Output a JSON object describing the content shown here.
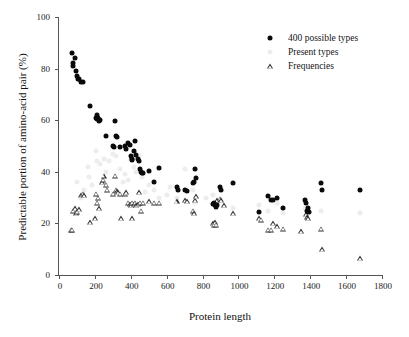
{
  "chart_data": {
    "type": "scatter",
    "title": "",
    "xlabel": "Protein length",
    "ylabel": "Predictable portion of amino-acid pair (%)",
    "xlim": [
      0,
      1800
    ],
    "ylim": [
      0,
      100
    ],
    "xticks": [
      0,
      200,
      400,
      600,
      800,
      1000,
      1200,
      1400,
      1600,
      1800
    ],
    "yticks": [
      0,
      20,
      40,
      60,
      80,
      100
    ],
    "grid": false,
    "legend_position": "top-right",
    "series": [
      {
        "name": "400 possible types",
        "marker": "filled-circle",
        "color": "#0a0a0a",
        "points": [
          [
            70,
            86
          ],
          [
            78,
            81
          ],
          [
            80,
            82
          ],
          [
            88,
            84
          ],
          [
            95,
            79
          ],
          [
            100,
            77
          ],
          [
            108,
            76
          ],
          [
            112,
            76
          ],
          [
            125,
            75
          ],
          [
            132,
            75
          ],
          [
            175,
            65.5
          ],
          [
            205,
            61
          ],
          [
            210,
            62
          ],
          [
            213,
            60.5
          ],
          [
            218,
            61
          ],
          [
            222,
            59.5
          ],
          [
            228,
            60
          ],
          [
            262,
            54
          ],
          [
            300,
            50
          ],
          [
            305,
            49.5
          ],
          [
            312,
            59.5
          ],
          [
            318,
            54
          ],
          [
            322,
            53.5
          ],
          [
            340,
            49.5
          ],
          [
            370,
            50
          ],
          [
            375,
            49
          ],
          [
            385,
            51
          ],
          [
            395,
            50.5
          ],
          [
            400,
            46
          ],
          [
            405,
            45
          ],
          [
            408,
            44.5
          ],
          [
            418,
            48
          ],
          [
            422,
            52
          ],
          [
            430,
            46.5
          ],
          [
            438,
            45
          ],
          [
            448,
            44
          ],
          [
            452,
            41
          ],
          [
            458,
            40
          ],
          [
            462,
            39.5
          ],
          [
            468,
            39.5
          ],
          [
            500,
            40.5
          ],
          [
            530,
            36
          ],
          [
            560,
            41.5
          ],
          [
            655,
            34
          ],
          [
            662,
            33
          ],
          [
            700,
            33
          ],
          [
            712,
            32.5
          ],
          [
            745,
            35.5
          ],
          [
            752,
            36
          ],
          [
            760,
            41
          ],
          [
            765,
            37.5
          ],
          [
            858,
            27.5
          ],
          [
            865,
            28
          ],
          [
            870,
            27
          ],
          [
            875,
            26.5
          ],
          [
            880,
            27
          ],
          [
            898,
            34
          ],
          [
            905,
            33
          ],
          [
            968,
            35.5
          ],
          [
            1115,
            24.5
          ],
          [
            1165,
            30.5
          ],
          [
            1180,
            29
          ],
          [
            1195,
            29
          ],
          [
            1215,
            30
          ],
          [
            1248,
            26
          ],
          [
            1370,
            29
          ],
          [
            1378,
            28
          ],
          [
            1382,
            25
          ],
          [
            1390,
            26
          ],
          [
            1392,
            24.5
          ],
          [
            1462,
            35.5
          ],
          [
            1468,
            33
          ],
          [
            1680,
            33
          ]
        ]
      },
      {
        "name": "Present types",
        "marker": "light-circle",
        "color": "#ededed",
        "points": [
          [
            98,
            36
          ],
          [
            160,
            42
          ],
          [
            168,
            38
          ],
          [
            205,
            48
          ],
          [
            212,
            44
          ],
          [
            248,
            45
          ],
          [
            262,
            40
          ],
          [
            300,
            47
          ],
          [
            318,
            46
          ],
          [
            340,
            41
          ],
          [
            370,
            39
          ],
          [
            385,
            37
          ],
          [
            400,
            45
          ],
          [
            418,
            42
          ],
          [
            448,
            46
          ],
          [
            462,
            38
          ],
          [
            500,
            35
          ],
          [
            530,
            33
          ],
          [
            560,
            30
          ],
          [
            620,
            34
          ],
          [
            655,
            30
          ],
          [
            700,
            41
          ],
          [
            745,
            33
          ],
          [
            760,
            28
          ],
          [
            858,
            31
          ],
          [
            905,
            29
          ],
          [
            968,
            26
          ],
          [
            1115,
            27
          ],
          [
            1165,
            25
          ],
          [
            1215,
            28
          ],
          [
            1248,
            24
          ],
          [
            1370,
            26
          ],
          [
            1462,
            25
          ],
          [
            1680,
            24
          ],
          [
            120,
            30
          ],
          [
            140,
            33
          ],
          [
            185,
            35
          ],
          [
            230,
            43
          ],
          [
            280,
            44
          ],
          [
            355,
            36
          ],
          [
            430,
            40
          ],
          [
            480,
            32
          ],
          [
            600,
            31
          ],
          [
            820,
            30
          ]
        ]
      },
      {
        "name": "Frequencies",
        "marker": "open-triangle",
        "color": "#2a2a2a",
        "points": [
          [
            68,
            17.5
          ],
          [
            75,
            17.5
          ],
          [
            80,
            25
          ],
          [
            90,
            26
          ],
          [
            95,
            24
          ],
          [
            100,
            24.5
          ],
          [
            112,
            25.5
          ],
          [
            125,
            31
          ],
          [
            132,
            31.5
          ],
          [
            140,
            31
          ],
          [
            175,
            20.5
          ],
          [
            200,
            22
          ],
          [
            208,
            31.5
          ],
          [
            212,
            28
          ],
          [
            218,
            30
          ],
          [
            224,
            26
          ],
          [
            240,
            36
          ],
          [
            244,
            37
          ],
          [
            248,
            38.5
          ],
          [
            262,
            35
          ],
          [
            268,
            33
          ],
          [
            300,
            31.5
          ],
          [
            312,
            38.5
          ],
          [
            318,
            33
          ],
          [
            322,
            32.5
          ],
          [
            330,
            32
          ],
          [
            340,
            31.5
          ],
          [
            348,
            22
          ],
          [
            370,
            31.5
          ],
          [
            375,
            32
          ],
          [
            385,
            28
          ],
          [
            395,
            27.5
          ],
          [
            400,
            27
          ],
          [
            405,
            28
          ],
          [
            408,
            22
          ],
          [
            418,
            27.5
          ],
          [
            422,
            28
          ],
          [
            430,
            27
          ],
          [
            438,
            27.5
          ],
          [
            448,
            32
          ],
          [
            452,
            28
          ],
          [
            458,
            25
          ],
          [
            468,
            28
          ],
          [
            500,
            28.5
          ],
          [
            530,
            28
          ],
          [
            560,
            28
          ],
          [
            655,
            28.5
          ],
          [
            700,
            29
          ],
          [
            712,
            28.5
          ],
          [
            745,
            25
          ],
          [
            752,
            24
          ],
          [
            760,
            29
          ],
          [
            765,
            30.5
          ],
          [
            858,
            20
          ],
          [
            865,
            19.5
          ],
          [
            870,
            20.5
          ],
          [
            875,
            19.5
          ],
          [
            880,
            29
          ],
          [
            898,
            29.5
          ],
          [
            905,
            29
          ],
          [
            920,
            27
          ],
          [
            968,
            24
          ],
          [
            1115,
            22
          ],
          [
            1125,
            21.5
          ],
          [
            1165,
            17.5
          ],
          [
            1180,
            17.5
          ],
          [
            1195,
            20
          ],
          [
            1215,
            19
          ],
          [
            1248,
            18
          ],
          [
            1348,
            17
          ],
          [
            1378,
            23.5
          ],
          [
            1382,
            22.5
          ],
          [
            1390,
            22
          ],
          [
            1462,
            18
          ],
          [
            1468,
            10
          ],
          [
            1680,
            6.5
          ]
        ]
      }
    ]
  }
}
